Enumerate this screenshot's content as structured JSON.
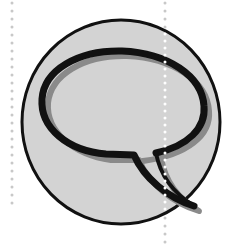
{
  "illustration": {
    "subject": "speech-bubble-icon",
    "colors": {
      "background": "#ffffff",
      "circle_fill": "#d3d3d3",
      "outline": "#111111",
      "shadow": "#8a8a8a",
      "dotted_guide_outside": "#c8c8c8",
      "dotted_guide_inside": "#ffffff"
    }
  }
}
